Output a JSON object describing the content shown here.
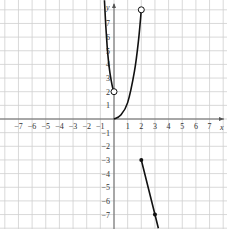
{
  "chart_data": {
    "type": "line",
    "title": "",
    "xlabel": "x",
    "ylabel": "y",
    "xlim": [
      -8.3,
      8.3
    ],
    "ylim": [
      -8.0,
      8.7
    ],
    "grid": true,
    "x_ticks": [
      -7,
      -6,
      -5,
      -4,
      -3,
      -2,
      -1,
      1,
      2,
      3,
      4,
      5,
      6,
      7
    ],
    "y_ticks": [
      -7,
      -6,
      -5,
      -4,
      -3,
      -2,
      -1,
      1,
      2,
      3,
      4,
      5,
      6,
      7
    ],
    "series": [
      {
        "name": "left-branch",
        "style": "curve",
        "points": [
          [
            -0.7,
            8.7
          ],
          [
            -0.6,
            6.8
          ],
          [
            -0.5,
            5.3
          ],
          [
            -0.4,
            4.2
          ],
          [
            -0.3,
            3.4
          ],
          [
            -0.2,
            2.8
          ],
          [
            -0.1,
            2.3
          ],
          [
            0,
            2
          ]
        ],
        "end_marker": "open"
      },
      {
        "name": "right-branch",
        "style": "curve",
        "points": [
          [
            0,
            0
          ],
          [
            0.5,
            0.3
          ],
          [
            1,
            1.2
          ],
          [
            1.5,
            3.5
          ],
          [
            1.8,
            5.8
          ],
          [
            2,
            8
          ]
        ],
        "end_marker": "open"
      },
      {
        "name": "line-segment",
        "style": "line",
        "points": [
          [
            2,
            -3
          ],
          [
            3,
            -7
          ],
          [
            3.25,
            -8
          ]
        ],
        "start_marker": "closed",
        "mid_marker": [
          3,
          -7
        ]
      }
    ],
    "open_points": [
      [
        0,
        2
      ],
      [
        2,
        8
      ]
    ],
    "closed_points": [
      [
        2,
        -3
      ],
      [
        3,
        -7
      ]
    ]
  },
  "labels": {
    "x_axis": "x",
    "y_axis": "y"
  }
}
